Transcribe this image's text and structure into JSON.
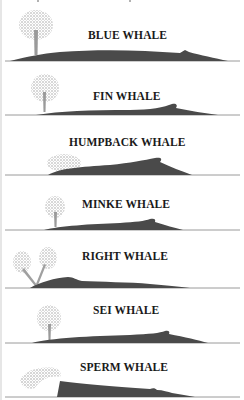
{
  "figure": {
    "colors": {
      "body": "#4a4a4a",
      "spray": "#8c8c8c",
      "waterline": "#9a9a9a",
      "text": "#1a1a1a"
    },
    "whales": [
      {
        "name": "BLUE WHALE",
        "blow": "tall single column"
      },
      {
        "name": "FIN WHALE",
        "blow": "tall single column"
      },
      {
        "name": "HUMPBACK WHALE",
        "blow": "low bushy"
      },
      {
        "name": "MINKE WHALE",
        "blow": "small single column"
      },
      {
        "name": "RIGHT WHALE",
        "blow": "V-shaped double"
      },
      {
        "name": "SEI WHALE",
        "blow": "single column"
      },
      {
        "name": "SPERM WHALE",
        "blow": "angled forward to left"
      }
    ]
  }
}
